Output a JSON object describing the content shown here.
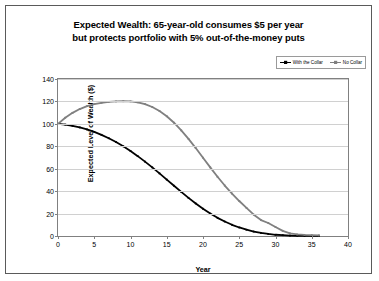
{
  "chart_data": {
    "type": "line",
    "title": "Expected Wealth: 65-year-old consumes $5 per year but protects portfolio with 5% out-of-the-money puts",
    "title_lines": [
      "Expected Wealth: 65-year-old consumes $5 per year",
      "but protects portfolio with 5% out-of-the-money puts"
    ],
    "xlabel": "Year",
    "ylabel": "Expected Level of Wealth ($)",
    "xlim": [
      0,
      40
    ],
    "ylim": [
      0,
      140
    ],
    "xticks": [
      0,
      5,
      10,
      15,
      20,
      25,
      30,
      35,
      40
    ],
    "yticks": [
      0,
      20,
      40,
      60,
      80,
      100,
      120,
      140
    ],
    "grid": "horizontal",
    "legend_position": "top-right",
    "series": [
      {
        "name": "With the Collar",
        "color": "#000000",
        "marker": "line-with-small-markers",
        "x": [
          0,
          1,
          2,
          3,
          4,
          5,
          6,
          7,
          8,
          9,
          10,
          11,
          12,
          13,
          14,
          15,
          16,
          17,
          18,
          19,
          20,
          21,
          22,
          23,
          24,
          25,
          26,
          27,
          28,
          29,
          30,
          31,
          32,
          33,
          34,
          35,
          36
        ],
        "values": [
          100,
          99.3,
          98.2,
          96.8,
          95.0,
          92.8,
          90.2,
          87.2,
          83.8,
          80.0,
          75.8,
          71.2,
          66.3,
          61.2,
          55.8,
          50.3,
          44.8,
          39.3,
          34.0,
          29.0,
          24.3,
          20.0,
          16.2,
          12.9,
          10.0,
          7.6,
          5.6,
          4.0,
          2.7,
          1.8,
          1.1,
          0.7,
          0.4,
          0.2,
          0.1,
          0.05,
          0
        ]
      },
      {
        "name": "No Collar",
        "color": "#808080",
        "marker": "line-with-small-markers",
        "x": [
          0,
          1,
          2,
          3,
          4,
          5,
          6,
          7,
          8,
          9,
          10,
          11,
          12,
          13,
          14,
          15,
          16,
          17,
          18,
          19,
          20,
          21,
          22,
          23,
          24,
          25,
          26,
          27,
          28,
          29,
          30,
          31,
          32,
          33,
          34,
          35,
          36
        ],
        "values": [
          100,
          105.5,
          109.8,
          113.2,
          115.8,
          117.6,
          118.8,
          119.6,
          120.0,
          120.2,
          120.0,
          119.2,
          117.6,
          115.0,
          111.4,
          106.8,
          101.0,
          94.2,
          86.6,
          78.4,
          69.8,
          61.2,
          52.8,
          45.0,
          37.8,
          31.2,
          25.0,
          19.0,
          14.2,
          11.6,
          8.0,
          4.6,
          2.4,
          1.4,
          1.0,
          0.8,
          0.6
        ]
      }
    ]
  },
  "legend": {
    "items": [
      {
        "label": "With the Collar",
        "color": "#000000"
      },
      {
        "label": "No Collar",
        "color": "#808080"
      }
    ]
  }
}
